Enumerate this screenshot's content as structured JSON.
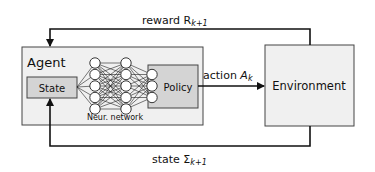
{
  "diagram": {
    "agent": {
      "label": "Agent"
    },
    "state_box": {
      "label": "State"
    },
    "policy_box": {
      "label": "Policy"
    },
    "network": {
      "label": "Neur. network",
      "layers": [
        5,
        5,
        3
      ]
    },
    "environment": {
      "label": "Environment"
    },
    "edges": {
      "reward": {
        "text": "reward R",
        "sub": "k+1"
      },
      "action": {
        "text": "action ",
        "var": "A",
        "sub": "k"
      },
      "state": {
        "text": "state Σ",
        "sub": "k+1"
      }
    },
    "colors": {
      "box_fill": "#f0f0f0",
      "inner_fill": "#d4d4d4",
      "stroke": "#333333",
      "line": "#111111"
    }
  }
}
